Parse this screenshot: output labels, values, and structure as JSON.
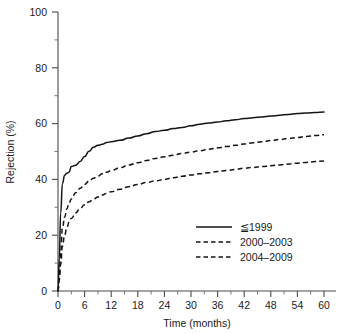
{
  "chart_data": {
    "type": "line",
    "title": "",
    "xlabel": "Time (months)",
    "ylabel": "Rejection (%)",
    "xlim": [
      0,
      60
    ],
    "ylim": [
      0,
      100
    ],
    "xticks": [
      0,
      6,
      12,
      18,
      24,
      30,
      36,
      42,
      48,
      54,
      60
    ],
    "xtick_labels": [
      "0",
      "6",
      "12",
      "18",
      "24",
      "30",
      "36",
      "42",
      "48",
      "54",
      "60"
    ],
    "yticks": [
      0,
      20,
      40,
      60,
      80,
      100
    ],
    "ytick_labels": [
      "0",
      "20",
      "40",
      "60",
      "80",
      "100"
    ],
    "x_minor_step": 3,
    "y_minor_step": 10,
    "grid": false,
    "legend_position": "center-right-lower",
    "x": [
      0,
      0.3,
      0.6,
      1,
      1.5,
      2,
      2.5,
      3,
      4,
      5,
      6,
      7,
      8,
      9,
      10,
      11,
      12,
      14,
      16,
      18,
      20,
      22,
      24,
      26,
      28,
      30,
      32,
      34,
      36,
      38,
      40,
      42,
      44,
      46,
      48,
      50,
      52,
      54,
      56,
      58,
      60
    ],
    "series": [
      {
        "name": "≦ 1999",
        "label": "≦1999",
        "style": "solid",
        "color": "#141414",
        "values": [
          0,
          12,
          28,
          38.5,
          41.5,
          42.2,
          42.6,
          44.6,
          45.1,
          46.4,
          48.2,
          50.1,
          51.5,
          52.2,
          52.6,
          53.2,
          53.5,
          54.0,
          54.8,
          55.6,
          56.4,
          57.2,
          57.6,
          58.2,
          58.6,
          59.2,
          59.8,
          60.2,
          60.6,
          61.0,
          61.4,
          61.8,
          62.1,
          62.4,
          62.7,
          63.0,
          63.3,
          63.6,
          63.8,
          64.0,
          64.2
        ]
      },
      {
        "name": "2000-2003",
        "label": "2000–2003",
        "style": "dashed",
        "color": "#141414",
        "values": [
          0,
          6,
          14,
          22.5,
          26.5,
          29.5,
          31.5,
          33.0,
          35.2,
          36.8,
          38.2,
          39.4,
          40.4,
          41.2,
          42.0,
          42.6,
          43.2,
          44.2,
          45.2,
          46.0,
          46.8,
          47.5,
          48.1,
          48.7,
          49.3,
          49.8,
          50.3,
          50.8,
          51.3,
          51.8,
          52.2,
          52.7,
          53.1,
          53.5,
          53.9,
          54.3,
          54.7,
          55.0,
          55.4,
          55.7,
          56.0
        ]
      },
      {
        "name": "2004-2009",
        "label": "2004–2009",
        "style": "dashed",
        "color": "#141414",
        "values": [
          0,
          4,
          9.5,
          16.0,
          20.0,
          22.8,
          24.6,
          26.0,
          28.0,
          29.6,
          30.9,
          32.0,
          32.9,
          33.7,
          34.4,
          35.0,
          35.6,
          36.5,
          37.4,
          38.2,
          38.9,
          39.5,
          40.0,
          40.6,
          41.1,
          41.6,
          42.0,
          42.4,
          42.8,
          43.2,
          43.6,
          44.0,
          44.3,
          44.6,
          44.9,
          45.2,
          45.5,
          45.8,
          46.1,
          46.4,
          46.6
        ]
      }
    ]
  },
  "legend": {
    "items": [
      {
        "label": "≦1999",
        "style": "solid"
      },
      {
        "label": "2000–2003",
        "style": "dashed"
      },
      {
        "label": "2004–2009",
        "style": "dashed"
      }
    ]
  }
}
